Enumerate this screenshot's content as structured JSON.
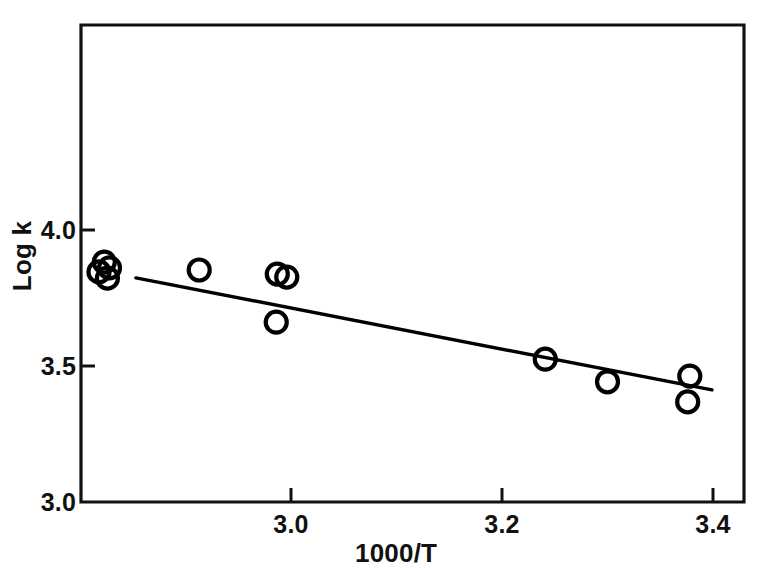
{
  "chart_data": {
    "type": "scatter",
    "title": "",
    "subtitle": "",
    "xlabel": "1000/T",
    "ylabel": "Log k",
    "xlim": [
      2.78,
      3.43
    ],
    "ylim": [
      3.0,
      4.14
    ],
    "xticks": [
      "3.0",
      "3.2",
      "3.4"
    ],
    "xtick_values": [
      3.0,
      3.2,
      3.4
    ],
    "yticks": [
      "3.0",
      "3.5",
      "4.0"
    ],
    "ytick_values": [
      3.0,
      3.5,
      4.0
    ],
    "grid": false,
    "legend": false,
    "legend_position": "none",
    "marker": "open-circle",
    "marker_color": "#000000",
    "line_color": "#000000",
    "axis_color": "#000000",
    "background_color": "#ffffff",
    "series": [
      {
        "name": "Log k vs 1000/T",
        "type": "scatter",
        "points": [
          {
            "x": 2.823,
            "y": 3.882
          },
          {
            "x": 2.828,
            "y": 3.861
          },
          {
            "x": 2.818,
            "y": 3.846
          },
          {
            "x": 2.826,
            "y": 3.823
          },
          {
            "x": 2.913,
            "y": 3.853
          },
          {
            "x": 2.987,
            "y": 3.838
          },
          {
            "x": 2.996,
            "y": 3.827
          },
          {
            "x": 2.986,
            "y": 3.661
          },
          {
            "x": 3.241,
            "y": 3.525
          },
          {
            "x": 3.3,
            "y": 3.442
          },
          {
            "x": 3.378,
            "y": 3.463
          },
          {
            "x": 3.376,
            "y": 3.368
          }
        ]
      },
      {
        "name": "least-squares fit",
        "type": "line",
        "x": [
          2.853,
          3.399
        ],
        "y": [
          3.824,
          3.412
        ]
      }
    ]
  },
  "axes": {
    "y_label": "Log k",
    "x_label": "1000/T",
    "y_tick_labels": [
      "4.0",
      "3.5",
      "3.0"
    ],
    "x_tick_labels": [
      "3.0",
      "3.2",
      "3.4"
    ]
  }
}
